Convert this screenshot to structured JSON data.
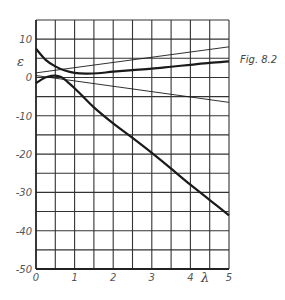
{
  "chart_data": {
    "type": "line",
    "title": "",
    "figure_label": "Fig. 8.2",
    "xlabel": "λ",
    "ylabel": "ε",
    "xlim": [
      0,
      5
    ],
    "ylim": [
      -50,
      15
    ],
    "x_ticks": [
      "0",
      "1",
      "2",
      "3",
      "4",
      "5"
    ],
    "y_ticks": [
      "10",
      "0",
      "-10",
      "-20",
      "-30",
      "-40",
      "-50"
    ],
    "grid": true,
    "grid_x_step": 0.5,
    "grid_y_step": 5,
    "legend": "none",
    "series": [
      {
        "name": "upper thick curve",
        "style": "thick",
        "x": [
          0,
          0.25,
          0.5,
          0.75,
          1.0,
          1.3,
          1.6,
          2.0,
          2.5,
          3.0,
          3.5,
          4.0,
          4.5,
          5.0
        ],
        "values": [
          7.5,
          4.6,
          2.9,
          1.8,
          1.2,
          1.0,
          1.1,
          1.5,
          1.9,
          2.3,
          2.8,
          3.3,
          3.8,
          4.2
        ]
      },
      {
        "name": "lower thick curve",
        "style": "thick",
        "x": [
          0,
          0.15,
          0.3,
          0.5,
          0.65,
          0.8,
          1.0,
          1.2,
          1.5,
          2.0,
          2.5,
          3.0,
          3.5,
          4.0,
          4.5,
          5.0
        ],
        "values": [
          -1.5,
          -0.5,
          0.2,
          0.5,
          0.1,
          -1.0,
          -2.8,
          -4.8,
          -7.8,
          -12.0,
          -15.8,
          -19.7,
          -23.8,
          -28.0,
          -32.0,
          -36.0
        ]
      },
      {
        "name": "upper thin line",
        "style": "thin",
        "x": [
          0,
          5
        ],
        "values": [
          1.2,
          8.0
        ]
      },
      {
        "name": "lower thin line",
        "style": "thin",
        "x": [
          0,
          5
        ],
        "values": [
          0.5,
          -6.5
        ]
      }
    ]
  }
}
